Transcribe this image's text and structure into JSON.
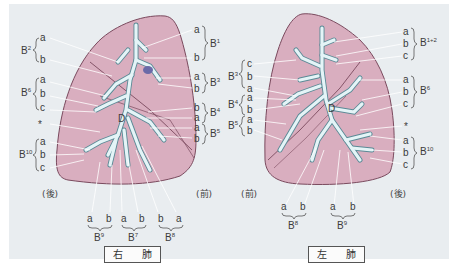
{
  "colors": {
    "background": "#e9edf0",
    "lung_fill": "#d9aebf",
    "lung_outline": "#7a4a5e",
    "bronchus": "#e4f4f7",
    "bronchus_outline": "#5a8a96",
    "leader_line": "#ffffff",
    "text": "#3b3b3b"
  },
  "right_lung": {
    "caption": "右 肺",
    "posterior_label": "(後)",
    "anterior_label": "(前)",
    "left_groups": [
      {
        "segment": "B",
        "sup": "2",
        "subs": [
          "a",
          "b"
        ]
      },
      {
        "segment": "B",
        "sup": "6",
        "subs": [
          "a",
          "b",
          "c"
        ]
      },
      {
        "segment": "*",
        "sup": "",
        "subs": []
      },
      {
        "segment": "B",
        "sup": "10",
        "subs": [
          "a",
          "b",
          "c"
        ]
      }
    ],
    "right_groups": [
      {
        "segment": "B",
        "sup": "1",
        "subs": [
          "a",
          "b"
        ]
      },
      {
        "segment": "B",
        "sup": "3",
        "subs": [
          "a",
          "b"
        ]
      },
      {
        "segment": "B",
        "sup": "4",
        "subs": [
          "b",
          "a"
        ]
      },
      {
        "segment": "B",
        "sup": "5",
        "subs": [
          "a",
          "b"
        ]
      }
    ],
    "bottom_groups": [
      {
        "segment": "B",
        "sup": "9",
        "subs": [
          "a",
          "b"
        ]
      },
      {
        "segment": "B",
        "sup": "7",
        "subs": [
          "a",
          "b"
        ]
      },
      {
        "segment": "B",
        "sup": "8",
        "subs": [
          "b",
          "a"
        ]
      }
    ],
    "marker": "D"
  },
  "left_lung": {
    "caption": "左 肺",
    "anterior_label": "(前)",
    "posterior_label": "(後)",
    "left_groups": [
      {
        "segment": "B",
        "sup": "3",
        "subs": [
          "c",
          "b",
          "a"
        ]
      },
      {
        "segment": "B",
        "sup": "4",
        "subs": [
          "a",
          "b"
        ]
      },
      {
        "segment": "B",
        "sup": "5",
        "subs": [
          "a",
          "b"
        ]
      }
    ],
    "right_groups": [
      {
        "segment": "B",
        "sup": "1+2",
        "subs": [
          "a",
          "b",
          "c"
        ]
      },
      {
        "segment": "B",
        "sup": "6",
        "subs": [
          "a",
          "b",
          "c"
        ]
      },
      {
        "segment": "*",
        "sup": "",
        "subs": []
      },
      {
        "segment": "B",
        "sup": "10",
        "subs": [
          "a",
          "b",
          "c"
        ]
      }
    ],
    "bottom_groups": [
      {
        "segment": "B",
        "sup": "8",
        "subs": [
          "a",
          "b"
        ]
      },
      {
        "segment": "B",
        "sup": "9",
        "subs": [
          "a",
          "b"
        ]
      }
    ],
    "marker": "D"
  }
}
